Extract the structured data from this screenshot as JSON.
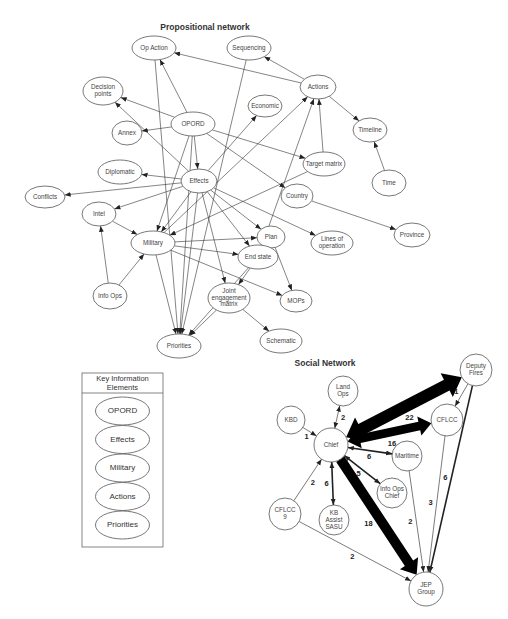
{
  "propositional_network": {
    "title": "Propositional network",
    "nodes": [
      {
        "id": "op_action",
        "label": [
          "Op Action"
        ]
      },
      {
        "id": "sequencing",
        "label": [
          "Sequencing"
        ]
      },
      {
        "id": "decision_points",
        "label": [
          "Decision",
          "points"
        ]
      },
      {
        "id": "actions",
        "label": [
          "Actions"
        ]
      },
      {
        "id": "economic",
        "label": [
          "Economic"
        ]
      },
      {
        "id": "annex",
        "label": [
          "Annex"
        ]
      },
      {
        "id": "opord",
        "label": [
          "OPORD"
        ]
      },
      {
        "id": "timeline",
        "label": [
          "Timeline"
        ]
      },
      {
        "id": "target_matrix",
        "label": [
          "Target matrix"
        ]
      },
      {
        "id": "diplomatic",
        "label": [
          "Diplomatic"
        ]
      },
      {
        "id": "effects",
        "label": [
          "Effects"
        ]
      },
      {
        "id": "time",
        "label": [
          "Time"
        ]
      },
      {
        "id": "conflicts",
        "label": [
          "Conflicts"
        ]
      },
      {
        "id": "country",
        "label": [
          "Country"
        ]
      },
      {
        "id": "intel",
        "label": [
          "Intel"
        ]
      },
      {
        "id": "military",
        "label": [
          "Military"
        ]
      },
      {
        "id": "plan",
        "label": [
          "Plan"
        ]
      },
      {
        "id": "lines_of_operation",
        "label": [
          "Lines of",
          "operation"
        ]
      },
      {
        "id": "province",
        "label": [
          "Province"
        ]
      },
      {
        "id": "end_state",
        "label": [
          "End state"
        ]
      },
      {
        "id": "info_ops",
        "label": [
          "Info Ops"
        ]
      },
      {
        "id": "joint_engagement_matrix",
        "label": [
          "Joint",
          "engagement",
          "matrix"
        ]
      },
      {
        "id": "mops",
        "label": [
          "MOPs"
        ]
      },
      {
        "id": "priorities",
        "label": [
          "Priorities"
        ]
      },
      {
        "id": "schematic",
        "label": [
          "Schematic"
        ]
      }
    ],
    "edges": [
      {
        "from": "actions",
        "to": "op_action"
      },
      {
        "from": "actions",
        "to": "sequencing"
      },
      {
        "from": "actions",
        "to": "timeline"
      },
      {
        "from": "time",
        "to": "timeline"
      },
      {
        "from": "target_matrix",
        "to": "actions"
      },
      {
        "from": "opord",
        "to": "op_action"
      },
      {
        "from": "opord",
        "to": "annex"
      },
      {
        "from": "opord",
        "to": "effects"
      },
      {
        "from": "opord",
        "to": "target_matrix"
      },
      {
        "from": "opord",
        "to": "country"
      },
      {
        "from": "opord",
        "to": "priorities"
      },
      {
        "from": "opord",
        "to": "military"
      },
      {
        "from": "effects",
        "to": "decision_points"
      },
      {
        "from": "effects",
        "to": "diplomatic"
      },
      {
        "from": "effects",
        "to": "conflicts"
      },
      {
        "from": "effects",
        "to": "economic"
      },
      {
        "from": "effects",
        "to": "intel"
      },
      {
        "from": "effects",
        "to": "military"
      },
      {
        "from": "effects",
        "to": "end_state"
      },
      {
        "from": "effects",
        "to": "plan"
      },
      {
        "from": "effects",
        "to": "lines_of_operation"
      },
      {
        "from": "effects",
        "to": "priorities"
      },
      {
        "from": "effects",
        "to": "joint_engagement_matrix"
      },
      {
        "from": "opord",
        "to": "decision_points"
      },
      {
        "from": "op_action",
        "to": "priorities"
      },
      {
        "from": "sequencing",
        "to": "priorities"
      },
      {
        "from": "target_matrix",
        "to": "military"
      },
      {
        "from": "end_state",
        "to": "actions"
      },
      {
        "from": "military",
        "to": "actions"
      },
      {
        "from": "country",
        "to": "province"
      },
      {
        "from": "intel",
        "to": "military"
      },
      {
        "from": "info_ops",
        "to": "intel"
      },
      {
        "from": "info_ops",
        "to": "military"
      },
      {
        "from": "military",
        "to": "plan"
      },
      {
        "from": "military",
        "to": "end_state"
      },
      {
        "from": "military",
        "to": "mops"
      },
      {
        "from": "military",
        "to": "priorities"
      },
      {
        "from": "plan",
        "to": "mops"
      },
      {
        "from": "end_state",
        "to": "priorities"
      },
      {
        "from": "end_state",
        "to": "joint_engagement_matrix"
      },
      {
        "from": "joint_engagement_matrix",
        "to": "priorities"
      },
      {
        "from": "joint_engagement_matrix",
        "to": "schematic"
      }
    ]
  },
  "social_network": {
    "title": "Social Network",
    "nodes": [
      {
        "id": "deputy_fires",
        "label": [
          "Deputy",
          "Fires"
        ]
      },
      {
        "id": "land_ops",
        "label": [
          "Land",
          "Ops"
        ]
      },
      {
        "id": "kbd",
        "label": [
          "KBD"
        ]
      },
      {
        "id": "cflcc",
        "label": [
          "CFLCC"
        ]
      },
      {
        "id": "chief",
        "label": [
          "Chief"
        ]
      },
      {
        "id": "maritime",
        "label": [
          "Maritime"
        ]
      },
      {
        "id": "info_ops_chief",
        "label": [
          "Info Ops",
          "Chief"
        ]
      },
      {
        "id": "cflcc_9",
        "label": [
          "CFLCC",
          "9"
        ]
      },
      {
        "id": "kb_assist_sasu",
        "label": [
          "KB",
          "Assist",
          "SASU"
        ]
      },
      {
        "id": "jep_group",
        "label": [
          "JEP",
          "Group"
        ]
      }
    ],
    "edges": [
      {
        "from": "chief",
        "to": "deputy_fires",
        "weight": "22",
        "bidirectional": true
      },
      {
        "from": "chief",
        "to": "cflcc",
        "weight": "16",
        "bidirectional": true
      },
      {
        "from": "chief",
        "to": "jep_group",
        "weight": "18",
        "bidirectional": false
      },
      {
        "from": "chief",
        "to": "land_ops",
        "weight": "2",
        "bidirectional": true
      },
      {
        "from": "kbd",
        "to": "chief",
        "weight": "1",
        "bidirectional": false
      },
      {
        "from": "chief",
        "to": "maritime",
        "weight": "6",
        "bidirectional": true
      },
      {
        "from": "chief",
        "to": "info_ops_chief",
        "weight": "5",
        "bidirectional": true
      },
      {
        "from": "chief",
        "to": "kb_assist_sasu",
        "weight": "6",
        "bidirectional": true
      },
      {
        "from": "cflcc_9",
        "to": "chief",
        "weight": "2",
        "bidirectional": false
      },
      {
        "from": "cflcc_9",
        "to": "jep_group",
        "weight": "2",
        "bidirectional": false
      },
      {
        "from": "deputy_fires",
        "to": "cflcc",
        "weight": "1",
        "bidirectional": false
      },
      {
        "from": "deputy_fires",
        "to": "jep_group",
        "weight": "6",
        "bidirectional": false
      },
      {
        "from": "cflcc",
        "to": "jep_group",
        "weight": "3",
        "bidirectional": false
      },
      {
        "from": "maritime",
        "to": "jep_group",
        "weight": "2",
        "bidirectional": false
      }
    ]
  },
  "legend": {
    "title": [
      "Key Information",
      "Elements"
    ],
    "items": [
      "OPORD",
      "Effects",
      "Military",
      "Actions",
      "Priorities"
    ]
  },
  "colors": {
    "stroke": "#555555",
    "edge": "#333333",
    "text": "#444444",
    "heavy_edge": "#000000"
  }
}
